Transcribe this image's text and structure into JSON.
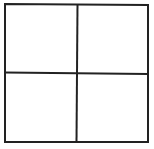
{
  "diagram": {
    "type": "grid",
    "rows": 2,
    "columns": 2,
    "cells": [
      {
        "row": 0,
        "col": 0,
        "label": ""
      },
      {
        "row": 0,
        "col": 1,
        "label": ""
      },
      {
        "row": 1,
        "col": 0,
        "label": ""
      },
      {
        "row": 1,
        "col": 1,
        "label": ""
      }
    ],
    "line_color": "#222222",
    "background_color": "#ffffff"
  }
}
